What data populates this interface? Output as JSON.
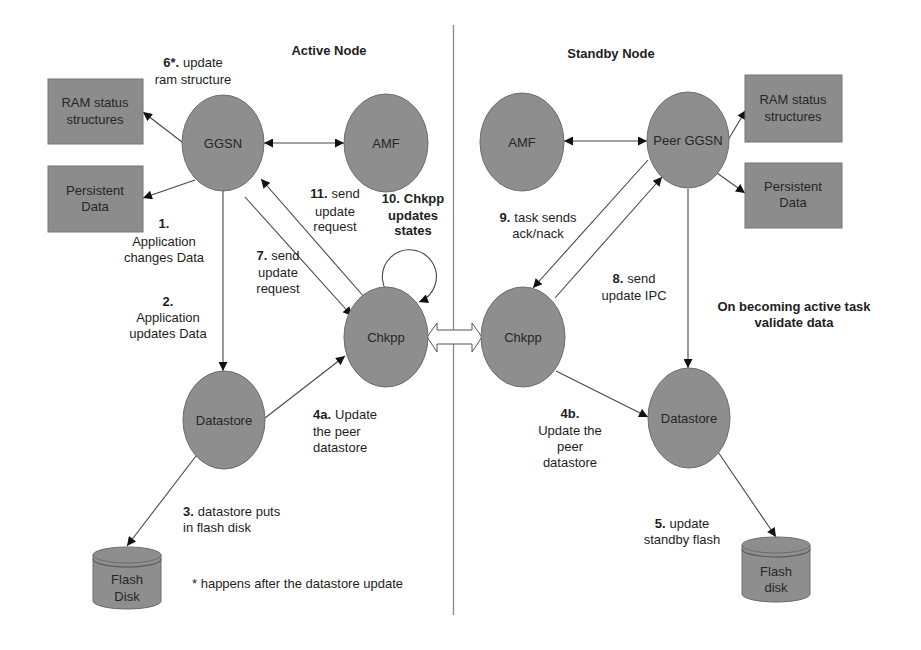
{
  "diagram": {
    "active_section": {
      "title": "Active Node"
    },
    "standby_section": {
      "title": "Standby Node"
    },
    "active": {
      "ggsn": "GGSN",
      "amf": "AMF",
      "chkpp": "Chkpp",
      "datastore": "Datastore",
      "ram_status": {
        "line1": "RAM status",
        "line2": "structures"
      },
      "persistent_data": {
        "line1": "Persistent",
        "line2": "Data"
      },
      "flash_disk": {
        "line1": "Flash",
        "line2": "Disk"
      }
    },
    "standby": {
      "ggsn": "Peer GGSN",
      "amf": "AMF",
      "chkpp": "Chkpp",
      "datastore": "Datastore",
      "ram_status": {
        "line1": "RAM status",
        "line2": "structures"
      },
      "persistent_data": {
        "line1": "Persistent",
        "line2": "Data"
      },
      "flash_disk": {
        "line1": "Flash",
        "line2": "disk"
      }
    },
    "steps": {
      "s1": {
        "num": "1.",
        "lines": [
          "Application",
          "changes Data"
        ]
      },
      "s2": {
        "num": "2.",
        "lines": [
          "Application",
          "updates Data"
        ]
      },
      "s3": {
        "num": "3.",
        "head": "datastore puts",
        "lines": [
          "in flash disk"
        ]
      },
      "s4a": {
        "num": "4a.",
        "head": "Update",
        "lines": [
          "the peer",
          "datastore"
        ]
      },
      "s4b": {
        "num": "4b.",
        "lines": [
          "Update the",
          "peer",
          "datastore"
        ]
      },
      "s5": {
        "num": "5.",
        "head": "update",
        "lines": [
          "standby flash"
        ]
      },
      "s6": {
        "num": "6*.",
        "head": "update",
        "lines": [
          "ram structure"
        ]
      },
      "s7": {
        "num": "7.",
        "head": "send",
        "lines": [
          "update",
          "request"
        ]
      },
      "s8": {
        "num": "8.",
        "head": "send",
        "lines": [
          "update IPC"
        ]
      },
      "s9": {
        "num": "9.",
        "head": "task sends",
        "lines": [
          "ack/nack"
        ]
      },
      "s10": {
        "num": "10.",
        "head": "Chkpp",
        "lines": [
          "updates",
          "states"
        ]
      },
      "s11": {
        "num": "11.",
        "head": "send",
        "lines": [
          "update",
          "request"
        ]
      }
    },
    "footnote": "* happens after the datastore update",
    "standby_note": {
      "line1": "On becoming active task",
      "line2": "validate data"
    }
  },
  "colors": {
    "background": "#ffffff",
    "node_fill": "#8e8e8e",
    "node_stroke": "#6c6c6c",
    "edge": "#474747",
    "text": "#1e1e1e"
  }
}
